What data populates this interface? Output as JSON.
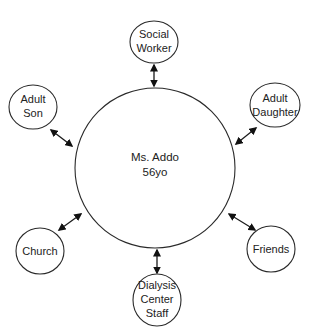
{
  "diagram": {
    "type": "ecomap",
    "center": {
      "line1": "Ms. Addo",
      "line2": "56yo"
    },
    "nodes": [
      {
        "id": "social-worker",
        "lines": [
          "Social",
          "Worker"
        ]
      },
      {
        "id": "adult-son",
        "lines": [
          "Adult",
          "Son"
        ]
      },
      {
        "id": "adult-daughter",
        "lines": [
          "Adult",
          "Daughter"
        ]
      },
      {
        "id": "church",
        "lines": [
          "Church"
        ]
      },
      {
        "id": "friends",
        "lines": [
          "Friends"
        ]
      },
      {
        "id": "dialysis-center-staff",
        "lines": [
          "Dialysis",
          "Center",
          "Staff"
        ]
      }
    ],
    "connections": [
      {
        "from": "center",
        "to": "social-worker",
        "arrow": "bidirectional"
      },
      {
        "from": "center",
        "to": "adult-son",
        "arrow": "bidirectional"
      },
      {
        "from": "center",
        "to": "adult-daughter",
        "arrow": "bidirectional"
      },
      {
        "from": "center",
        "to": "church",
        "arrow": "bidirectional"
      },
      {
        "from": "center",
        "to": "friends",
        "arrow": "bidirectional"
      },
      {
        "from": "center",
        "to": "dialysis-center-staff",
        "arrow": "bidirectional"
      }
    ],
    "colors": {
      "stroke": "#2a2a2a",
      "text": "#222222",
      "background": "#ffffff"
    }
  }
}
